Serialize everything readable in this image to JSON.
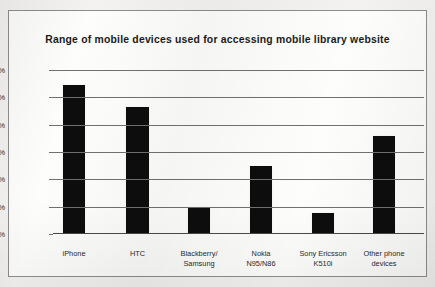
{
  "chart_data": {
    "type": "bar",
    "title": "Range of mobile devices used for accessing mobile library website",
    "xlabel": "",
    "ylabel": "",
    "categories": [
      "iPhone",
      "Blackberry/ Samsung",
      "HTC",
      "Nokia N95/N86",
      "Sony Ericsson K510i",
      "Other phone devices"
    ],
    "category_lines": [
      [
        "iPhone"
      ],
      [
        "HTC"
      ],
      [
        "Blackberry/",
        "Samsung"
      ],
      [
        "Nokia",
        "N95/N86"
      ],
      [
        "Sony Ericsson",
        "K510i"
      ],
      [
        "Other phone",
        "devices"
      ]
    ],
    "values": [
      27,
      23,
      4.8,
      12.2,
      3.7,
      17.8
    ],
    "ylim": [
      0,
      30
    ],
    "ytick_values": [
      0,
      5,
      10,
      15,
      20,
      25,
      30
    ],
    "ytick_labels": [
      "0%",
      "5%",
      "10%",
      "15%",
      "20%",
      "25%",
      "30%"
    ],
    "grid": true,
    "legend": false,
    "bar_color": "#0d0d0d",
    "grid_color": "#707070",
    "axis_color": "#4a4a4a",
    "plot_background": "#fdfdfc",
    "page_background": "#f3f2f0"
  }
}
